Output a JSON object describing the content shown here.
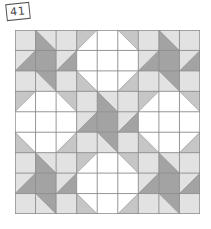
{
  "label": "41",
  "colors": {
    "W": "#ffffff",
    "L": "#e2e2e2",
    "M": "#c6c6c6",
    "D": "#a3a3a3",
    "line": "#8a8a8a"
  },
  "grid": {
    "rows": 9,
    "cols": 9,
    "cells": [
      [
        "L",
        {
          "d": "tlbr",
          "a": "L",
          "b": "D"
        },
        "L",
        {
          "d": "trbl",
          "a": "M",
          "b": "W"
        },
        "W",
        {
          "d": "tlbr",
          "a": "M",
          "b": "W"
        },
        "L",
        {
          "d": "tlbr",
          "a": "L",
          "b": "D"
        },
        "L"
      ],
      [
        {
          "d": "trbl",
          "a": "L",
          "b": "D"
        },
        "D",
        {
          "d": "trbl",
          "a": "L",
          "b": "D"
        },
        "W",
        "W",
        "W",
        {
          "d": "trbl",
          "a": "L",
          "b": "D"
        },
        "D",
        {
          "d": "trbl",
          "a": "L",
          "b": "D"
        }
      ],
      [
        "L",
        {
          "d": "tlbr",
          "a": "D",
          "b": "L"
        },
        "L",
        {
          "d": "tlbr",
          "a": "W",
          "b": "M"
        },
        "W",
        {
          "d": "trbl",
          "a": "W",
          "b": "M"
        },
        "L",
        {
          "d": "tlbr",
          "a": "D",
          "b": "L"
        },
        "L"
      ],
      [
        {
          "d": "trbl",
          "a": "M",
          "b": "W"
        },
        "W",
        {
          "d": "tlbr",
          "a": "M",
          "b": "W"
        },
        "L",
        {
          "d": "tlbr",
          "a": "L",
          "b": "D"
        },
        "L",
        {
          "d": "trbl",
          "a": "M",
          "b": "W"
        },
        "W",
        {
          "d": "tlbr",
          "a": "M",
          "b": "W"
        }
      ],
      [
        "W",
        "W",
        "W",
        {
          "d": "trbl",
          "a": "L",
          "b": "D"
        },
        "D",
        {
          "d": "trbl",
          "a": "L",
          "b": "D"
        },
        "W",
        "W",
        "W"
      ],
      [
        {
          "d": "tlbr",
          "a": "W",
          "b": "M"
        },
        "W",
        {
          "d": "trbl",
          "a": "W",
          "b": "M"
        },
        "L",
        {
          "d": "tlbr",
          "a": "D",
          "b": "L"
        },
        "L",
        {
          "d": "tlbr",
          "a": "W",
          "b": "M"
        },
        "W",
        {
          "d": "trbl",
          "a": "W",
          "b": "M"
        }
      ],
      [
        "L",
        {
          "d": "tlbr",
          "a": "L",
          "b": "D"
        },
        "L",
        {
          "d": "trbl",
          "a": "M",
          "b": "W"
        },
        "W",
        {
          "d": "tlbr",
          "a": "M",
          "b": "W"
        },
        "L",
        {
          "d": "tlbr",
          "a": "L",
          "b": "D"
        },
        "L"
      ],
      [
        {
          "d": "trbl",
          "a": "L",
          "b": "D"
        },
        "D",
        {
          "d": "trbl",
          "a": "L",
          "b": "D"
        },
        "W",
        "W",
        "W",
        {
          "d": "trbl",
          "a": "L",
          "b": "D"
        },
        "D",
        {
          "d": "trbl",
          "a": "L",
          "b": "D"
        }
      ],
      [
        "L",
        {
          "d": "tlbr",
          "a": "D",
          "b": "L"
        },
        "L",
        {
          "d": "tlbr",
          "a": "W",
          "b": "M"
        },
        "W",
        {
          "d": "trbl",
          "a": "W",
          "b": "M"
        },
        "L",
        {
          "d": "tlbr",
          "a": "D",
          "b": "L"
        },
        "L"
      ]
    ]
  }
}
